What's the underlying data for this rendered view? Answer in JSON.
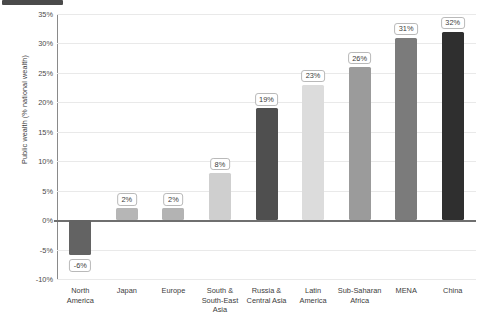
{
  "chart_data": {
    "type": "bar",
    "title": "",
    "xlabel": "",
    "ylabel": "Public wealth (% national wealth)",
    "categories": [
      "North\nAmerica",
      "Japan",
      "Europe",
      "South &\nSouth-East\nAsia",
      "Russia &\nCentral Asia",
      "Latin\nAmerica",
      "Sub-Saharan\nAfrica",
      "MENA",
      "China"
    ],
    "values": [
      -6,
      2,
      2,
      8,
      19,
      23,
      26,
      31,
      32
    ],
    "value_labels": [
      "-6%",
      "2%",
      "2%",
      "8%",
      "19%",
      "23%",
      "26%",
      "31%",
      "32%"
    ],
    "bar_colors": [
      "#636363",
      "#b6b6b6",
      "#b3b3b3",
      "#cfcfcf",
      "#4f4f4f",
      "#dcdcdc",
      "#9b9b9b",
      "#7b7b7b",
      "#2f2f2f"
    ],
    "ylim": [
      -10,
      35
    ],
    "ytick_values": [
      35,
      30,
      25,
      20,
      15,
      10,
      5,
      0,
      -5,
      -10
    ],
    "ytick_labels": [
      "35%",
      "30%",
      "25%",
      "20%",
      "15%",
      "10%",
      "5%",
      "0%",
      "-5%",
      "-10%"
    ],
    "grid": true,
    "legend": "none",
    "zero_line": true
  }
}
